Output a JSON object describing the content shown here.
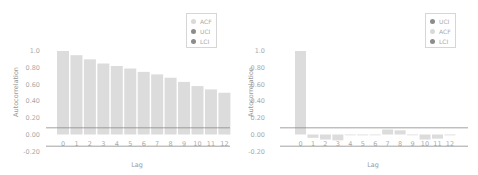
{
  "colors": {
    "bar": "#dcdcdc",
    "acf_dot": "#d9d9d9",
    "uci_dot": "#8c8c8c",
    "lci_dot": "#8c8c8c",
    "ci_line": "#8a8a8a",
    "tick_text": "#aaaaaa"
  },
  "chart_data": [
    {
      "type": "bar",
      "title": "",
      "xlabel": "Lag",
      "ylabel": "Autocorrelation",
      "categories": [
        "0",
        "1",
        "2",
        "3",
        "4",
        "5",
        "6",
        "7",
        "8",
        "9",
        "10",
        "11",
        "12"
      ],
      "series": [
        {
          "name": "ACF",
          "values": [
            1.0,
            0.95,
            0.9,
            0.85,
            0.82,
            0.79,
            0.75,
            0.72,
            0.68,
            0.63,
            0.58,
            0.54,
            0.5
          ]
        },
        {
          "name": "UCI",
          "values": [
            0.08,
            0.08,
            0.08,
            0.08,
            0.08,
            0.08,
            0.08,
            0.08,
            0.08,
            0.08,
            0.08,
            0.08,
            0.08
          ]
        },
        {
          "name": "LCI",
          "values": [
            -0.14,
            -0.14,
            -0.14,
            -0.14,
            -0.14,
            -0.14,
            -0.14,
            -0.14,
            -0.14,
            -0.14,
            -0.14,
            -0.14,
            -0.14
          ]
        }
      ],
      "yticks": [
        "1.0",
        "0.80",
        "0.60",
        "0.40",
        "0.20",
        "0.00",
        "-0.20"
      ],
      "ylim": [
        -0.2,
        1.0
      ],
      "legend": [
        "ACF",
        "UCI",
        "LCI"
      ],
      "legend_position": "top-right",
      "grid": false
    },
    {
      "type": "bar",
      "title": "",
      "xlabel": "Lag",
      "ylabel": "Autocorrelation",
      "categories": [
        "0",
        "1",
        "2",
        "3",
        "4",
        "5",
        "6",
        "7",
        "8",
        "9",
        "10",
        "11",
        "12"
      ],
      "series": [
        {
          "name": "ACF",
          "values": [
            1.0,
            -0.04,
            -0.06,
            -0.07,
            -0.005,
            -0.01,
            0.0,
            0.06,
            0.05,
            -0.005,
            -0.06,
            -0.05,
            -0.01
          ]
        },
        {
          "name": "UCI",
          "values": [
            0.08,
            0.08,
            0.08,
            0.08,
            0.08,
            0.08,
            0.08,
            0.08,
            0.08,
            0.08,
            0.08,
            0.08,
            0.08
          ]
        },
        {
          "name": "LCI",
          "values": [
            -0.14,
            -0.14,
            -0.14,
            -0.14,
            -0.14,
            -0.14,
            -0.14,
            -0.14,
            -0.14,
            -0.14,
            -0.14,
            -0.14,
            -0.14
          ]
        }
      ],
      "yticks": [
        "1.0",
        "0.80",
        "0.60",
        "0.40",
        "0.20",
        "0.00",
        "-0.20"
      ],
      "ylim": [
        -0.2,
        1.0
      ],
      "legend": [
        "UCI",
        "ACF",
        "LCI"
      ],
      "legend_position": "top-right",
      "grid": false
    }
  ],
  "panels": [
    {
      "legend": [
        {
          "label": "ACF",
          "color": "#d9d9d9"
        },
        {
          "label": "UCI",
          "color": "#8c8c8c"
        },
        {
          "label": "LCI",
          "color": "#8c8c8c"
        }
      ]
    },
    {
      "legend": [
        {
          "label": "UCI",
          "color": "#8c8c8c"
        },
        {
          "label": "ACF",
          "color": "#d9d9d9"
        },
        {
          "label": "LCI",
          "color": "#8c8c8c"
        }
      ]
    }
  ]
}
